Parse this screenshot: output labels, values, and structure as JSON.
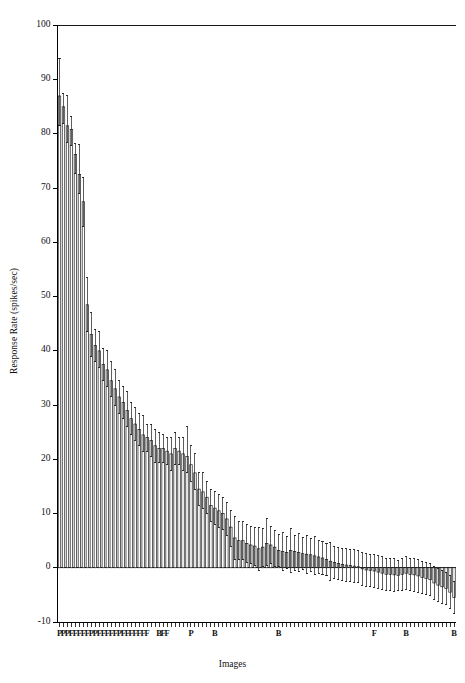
{
  "chart_data": {
    "type": "bar",
    "title": "",
    "subtitle": "",
    "xlabel": "Images",
    "ylabel": "Response Rate (spikes/sec)",
    "ylim": [
      -10,
      100
    ],
    "yticks": [
      -10,
      0,
      10,
      20,
      30,
      40,
      50,
      60,
      70,
      80,
      90,
      100
    ],
    "ytick_labels": [
      "-10",
      "0",
      "10",
      "20",
      "30",
      "40",
      "50",
      "60",
      "70",
      "80",
      "90",
      "100"
    ],
    "grid": false,
    "legend": null,
    "error_bars": "standard error / deviation bars (vertical caps)",
    "n_bars": 100,
    "categories": [
      "1",
      "2",
      "3",
      "4",
      "5",
      "6",
      "7",
      "8",
      "9",
      "10",
      "11",
      "12",
      "13",
      "14",
      "15",
      "16",
      "17",
      "18",
      "19",
      "20",
      "21",
      "22",
      "23",
      "24",
      "25",
      "26",
      "27",
      "28",
      "29",
      "30",
      "31",
      "32",
      "33",
      "34",
      "35",
      "36",
      "37",
      "38",
      "39",
      "40",
      "41",
      "42",
      "43",
      "44",
      "45",
      "46",
      "47",
      "48",
      "49",
      "50",
      "51",
      "52",
      "53",
      "54",
      "55",
      "56",
      "57",
      "58",
      "59",
      "60",
      "61",
      "62",
      "63",
      "64",
      "65",
      "66",
      "67",
      "68",
      "69",
      "70",
      "71",
      "72",
      "73",
      "74",
      "75",
      "76",
      "77",
      "78",
      "79",
      "80",
      "81",
      "82",
      "83",
      "84",
      "85",
      "86",
      "87",
      "88",
      "89",
      "90",
      "91",
      "92",
      "93",
      "94",
      "95",
      "96",
      "97",
      "98",
      "99",
      "100"
    ],
    "values": [
      87.0,
      85.0,
      81.5,
      80.8,
      76.2,
      72.5,
      67.5,
      48.5,
      43.0,
      41.0,
      40.0,
      37.5,
      36.5,
      34.5,
      33.0,
      31.5,
      30.5,
      29.0,
      27.5,
      26.5,
      25.5,
      24.5,
      24.0,
      23.5,
      22.5,
      22.0,
      22.0,
      21.5,
      21.0,
      22.0,
      21.5,
      21.0,
      20.5,
      19.0,
      17.5,
      14.5,
      14.0,
      13.0,
      11.5,
      11.0,
      10.5,
      10.0,
      9.0,
      7.5,
      5.5,
      5.0,
      5.0,
      4.5,
      4.2,
      4.0,
      3.5,
      3.8,
      4.5,
      4.2,
      3.8,
      3.2,
      3.0,
      2.8,
      3.2,
      3.0,
      2.8,
      2.6,
      2.5,
      2.4,
      2.2,
      2.0,
      1.8,
      1.5,
      1.2,
      1.0,
      0.8,
      0.6,
      0.5,
      0.4,
      0.3,
      0.2,
      -0.2,
      -0.4,
      -0.5,
      -0.6,
      -0.8,
      -1.0,
      -1.2,
      -1.2,
      -1.3,
      -1.4,
      -1.2,
      -1.0,
      -1.2,
      -1.3,
      -1.5,
      -1.8,
      -2.0,
      -2.2,
      -2.8,
      -3.2,
      -3.5,
      -3.8,
      -4.5,
      -5.5
    ],
    "errors_upper": [
      7.0,
      2.5,
      5.5,
      2.5,
      2.0,
      5.5,
      4.5,
      5.0,
      4.0,
      3.0,
      3.5,
      3.0,
      3.5,
      3.5,
      3.5,
      3.0,
      3.0,
      3.5,
      3.0,
      3.0,
      3.0,
      3.5,
      2.5,
      3.0,
      3.0,
      3.0,
      2.5,
      2.5,
      3.0,
      3.0,
      2.5,
      3.0,
      5.5,
      3.5,
      3.5,
      3.0,
      3.5,
      3.0,
      3.0,
      3.0,
      3.0,
      3.0,
      3.0,
      3.0,
      4.0,
      3.5,
      3.5,
      3.5,
      3.5,
      3.5,
      4.0,
      3.5,
      4.5,
      3.5,
      3.0,
      3.0,
      3.5,
      3.0,
      4.0,
      3.0,
      3.5,
      3.0,
      3.5,
      3.0,
      3.5,
      3.0,
      3.0,
      3.0,
      3.5,
      3.0,
      3.0,
      3.0,
      3.0,
      3.0,
      3.0,
      3.0,
      3.0,
      3.0,
      3.0,
      3.0,
      3.0,
      3.0,
      3.0,
      3.0,
      3.0,
      2.8,
      3.0,
      3.0,
      3.0,
      3.0,
      3.0,
      3.0,
      3.0,
      3.0,
      3.0,
      3.0,
      3.0,
      3.0,
      3.0,
      3.0
    ],
    "errors_lower": [
      5.5,
      3.0,
      3.0,
      3.0,
      3.5,
      3.5,
      4.5,
      5.0,
      4.0,
      3.0,
      3.0,
      3.0,
      3.0,
      3.0,
      3.0,
      3.0,
      3.0,
      3.0,
      3.0,
      3.0,
      3.0,
      3.0,
      2.5,
      3.0,
      3.0,
      2.5,
      2.5,
      2.5,
      3.0,
      3.0,
      2.5,
      3.0,
      3.0,
      3.0,
      3.0,
      3.0,
      3.0,
      3.0,
      3.0,
      3.0,
      3.0,
      3.0,
      3.0,
      3.5,
      4.0,
      3.5,
      3.5,
      3.5,
      3.5,
      3.5,
      4.0,
      3.5,
      4.0,
      3.5,
      3.5,
      3.0,
      3.5,
      3.0,
      4.0,
      3.5,
      3.5,
      3.0,
      3.5,
      3.0,
      3.5,
      3.0,
      3.0,
      3.0,
      3.5,
      3.0,
      3.0,
      3.0,
      3.0,
      3.0,
      3.0,
      3.0,
      3.0,
      3.0,
      3.0,
      3.0,
      3.0,
      3.0,
      3.0,
      3.0,
      3.0,
      2.8,
      3.0,
      3.0,
      3.0,
      3.0,
      3.0,
      3.0,
      3.0,
      3.0,
      3.0,
      3.0,
      3.0,
      3.0,
      3.0,
      3.0
    ],
    "xtick_group_labels": [
      {
        "index": 0,
        "label": "P"
      },
      {
        "index": 1,
        "label": "P"
      },
      {
        "index": 2,
        "label": "P"
      },
      {
        "index": 3,
        "label": "F"
      },
      {
        "index": 4,
        "label": "F"
      },
      {
        "index": 5,
        "label": "F"
      },
      {
        "index": 6,
        "label": "F"
      },
      {
        "index": 7,
        "label": "F"
      },
      {
        "index": 8,
        "label": "P"
      },
      {
        "index": 9,
        "label": "P"
      },
      {
        "index": 10,
        "label": "F"
      },
      {
        "index": 11,
        "label": "F"
      },
      {
        "index": 12,
        "label": "F"
      },
      {
        "index": 13,
        "label": "F"
      },
      {
        "index": 14,
        "label": "F"
      },
      {
        "index": 15,
        "label": "P"
      },
      {
        "index": 16,
        "label": "F"
      },
      {
        "index": 17,
        "label": "F"
      },
      {
        "index": 18,
        "label": "F"
      },
      {
        "index": 19,
        "label": "F"
      },
      {
        "index": 20,
        "label": "F"
      },
      {
        "index": 21,
        "label": "F"
      },
      {
        "index": 22,
        "label": "F"
      },
      {
        "index": 25,
        "label": "B"
      },
      {
        "index": 26,
        "label": "F"
      },
      {
        "index": 27,
        "label": "F"
      },
      {
        "index": 33,
        "label": "P"
      },
      {
        "index": 39,
        "label": "B"
      },
      {
        "index": 55,
        "label": "B"
      },
      {
        "index": 79,
        "label": "F"
      },
      {
        "index": 87,
        "label": "B"
      },
      {
        "index": 99,
        "label": "B"
      }
    ]
  }
}
